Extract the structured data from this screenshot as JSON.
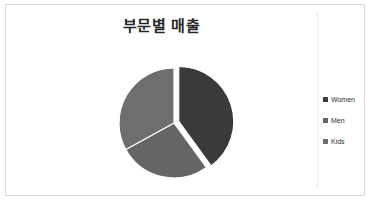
{
  "chart": {
    "title": "부문별 매출",
    "frame_border_color": "#d9d9d9",
    "background_color": "#ffffff"
  },
  "legend": {
    "position": "right",
    "items": [
      {
        "label": "Women",
        "color": "#3a3a3a",
        "marker": "square-marker-icon"
      },
      {
        "label": "Men",
        "color": "#656565",
        "marker": "square-marker-icon"
      },
      {
        "label": "Kids",
        "color": "#6e6e6e",
        "marker": "square-marker-icon"
      }
    ]
  },
  "chart_data": {
    "type": "pie",
    "title": "부문별 매출",
    "categories": [
      "Women",
      "Men",
      "Kids"
    ],
    "values": [
      40,
      27,
      33
    ],
    "colors": [
      "#3a3a3a",
      "#656565",
      "#6e6e6e"
    ],
    "exploded": [
      true,
      false,
      false
    ],
    "legend_position": "right",
    "xlabel": "",
    "ylabel": "",
    "grid": false
  }
}
